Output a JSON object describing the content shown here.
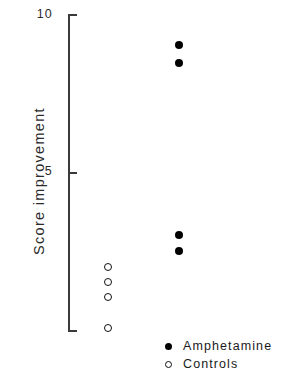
{
  "chart_data": {
    "type": "scatter",
    "title": "",
    "xlabel": "",
    "ylabel": "Score improvement",
    "ylim": [
      0,
      10
    ],
    "yticks": [
      5,
      10
    ],
    "ytick_labels": [
      "5",
      "10"
    ],
    "grid": false,
    "legend_position": "bottom-right",
    "series": [
      {
        "name": "Amphetamine",
        "marker": "filled-circle",
        "color": "#000000",
        "x_category": "amphetamine",
        "values": [
          9.0,
          8.4,
          3.0,
          2.5
        ],
        "points": [
          {
            "label": "9.0",
            "y": 9.0,
            "px_x": 179,
            "px_y": 45
          },
          {
            "label": "8.4",
            "y": 8.4,
            "px_x": 179,
            "px_y": 63
          },
          {
            "label": "3.0",
            "y": 3.0,
            "px_x": 179,
            "px_y": 235
          },
          {
            "label": "2.5",
            "y": 2.5,
            "px_x": 179,
            "px_y": 251
          }
        ]
      },
      {
        "name": "Controls",
        "marker": "open-circle",
        "color": "#ffffff",
        "x_category": "controls",
        "values": [
          2.0,
          1.5,
          1.05,
          0.05
        ],
        "points": [
          {
            "label": "2.0",
            "y": 2.0,
            "px_x": 108,
            "px_y": 267
          },
          {
            "label": "1.5",
            "y": 1.5,
            "px_x": 108,
            "px_y": 282
          },
          {
            "label": "1.05",
            "y": 1.05,
            "px_x": 108,
            "px_y": 297
          },
          {
            "label": "0.05",
            "y": 0.05,
            "px_x": 108,
            "px_y": 328
          }
        ]
      }
    ]
  },
  "axis": {
    "y_title": "Score improvement",
    "tick_label_top": "10",
    "tick_label_mid": "5",
    "axis_color": "#3a3a3a"
  },
  "legend": {
    "items": [
      {
        "marker": "filled-circle",
        "label": "Amphetamine"
      },
      {
        "marker": "open-circle",
        "label": "Controls"
      }
    ]
  }
}
